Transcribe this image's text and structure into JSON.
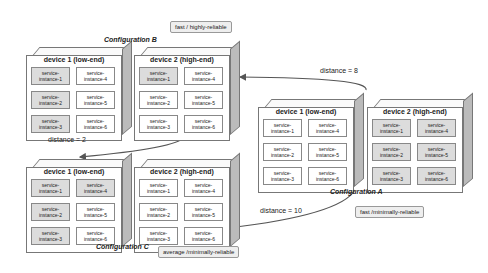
{
  "configurations": {
    "B": {
      "label": "Configuration B",
      "note": "fast / highly-reliable",
      "devices": [
        {
          "title": "device 1 (low-end)",
          "instances": [
            "service-\ninstance-1",
            "service-\ninstance-4",
            "service-\ninstance-2",
            "service-\ninstance-5",
            "service-\ninstance-3",
            "service-\ninstance-6"
          ],
          "highlighted": [
            true,
            false,
            true,
            false,
            true,
            false
          ]
        },
        {
          "title": "device 2 (high-end)",
          "instances": [
            "service-\ninstance-1",
            "service-\ninstance-4",
            "service-\ninstance-2",
            "service-\ninstance-5",
            "service-\ninstance-3",
            "service-\ninstance-6"
          ],
          "highlighted": [
            true,
            false,
            false,
            false,
            false,
            false
          ]
        }
      ]
    },
    "C": {
      "label": "Configuration C",
      "note": "average /minimally-reliable",
      "devices": [
        {
          "title": "device 1 (low-end)",
          "instances": [
            "service-\ninstance-1",
            "service-\ninstance-4",
            "service-\ninstance-2",
            "service-\ninstance-5",
            "service-\ninstance-3",
            "service-\ninstance-6"
          ],
          "highlighted": [
            true,
            true,
            true,
            false,
            true,
            false
          ]
        },
        {
          "title": "device 2 (high-end)",
          "instances": [
            "service-\ninstance-1",
            "service-\ninstance-4",
            "service-\ninstance-2",
            "service-\ninstance-5",
            "service-\ninstance-3",
            "service-\ninstance-6"
          ],
          "highlighted": [
            false,
            false,
            false,
            false,
            false,
            false
          ]
        }
      ]
    },
    "A": {
      "label": "Configuration A",
      "note": "fast /minimally-reliable",
      "devices": [
        {
          "title": "device 1 (low-end)",
          "instances": [
            "service-\ninstance-1",
            "service-\ninstance-4",
            "service-\ninstance-2",
            "service-\ninstance-5",
            "service-\ninstance-3",
            "service-\ninstance-6"
          ],
          "highlighted": [
            false,
            false,
            false,
            false,
            false,
            false
          ]
        },
        {
          "title": "device 2 (high-end)",
          "instances": [
            "service-\ninstance-1",
            "service-\ninstance-4",
            "service-\ninstance-2",
            "service-\ninstance-5",
            "service-\ninstance-3",
            "service-\ninstance-6"
          ],
          "highlighted": [
            true,
            true,
            true,
            true,
            true,
            true
          ]
        }
      ]
    }
  },
  "distances": {
    "A_to_B": "distance = 8",
    "B_to_C": "distance = 2",
    "A_to_C": "distance = 10"
  }
}
